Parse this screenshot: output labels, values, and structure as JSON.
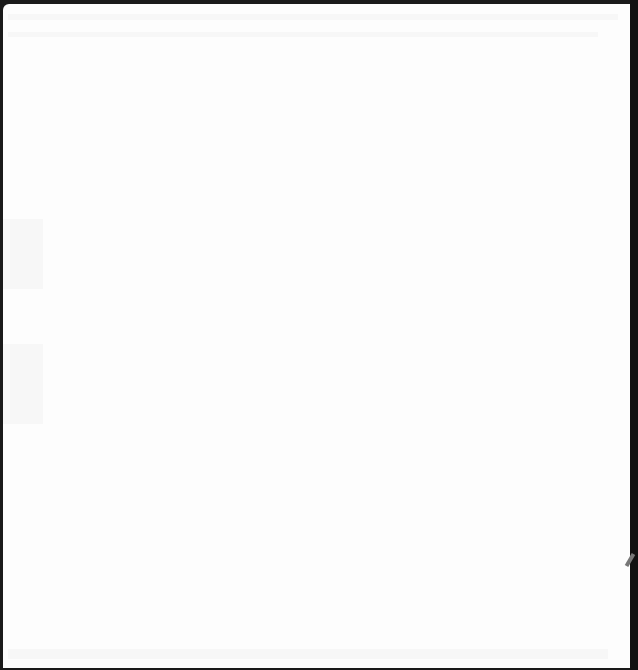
{
  "page": {
    "type": "blank-scanned-page",
    "text": ""
  }
}
